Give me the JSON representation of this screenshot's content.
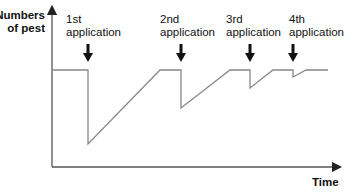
{
  "chart_data": {
    "type": "line",
    "title": "",
    "xlabel": "Time",
    "ylabel": "Numbers of pest",
    "ylabel_lines": [
      "Numbers",
      "of pest"
    ],
    "grid": false,
    "legend": null,
    "axis_ticks": "none",
    "series": [
      {
        "name": "Pest population",
        "color": "#888888",
        "points_px": [
          [
            52,
            70
          ],
          [
            88,
            70
          ],
          [
            88,
            144
          ],
          [
            160,
            70
          ],
          [
            181,
            70
          ],
          [
            181,
            108
          ],
          [
            230,
            70
          ],
          [
            250,
            70
          ],
          [
            250,
            88
          ],
          [
            273,
            70
          ],
          [
            293,
            70
          ],
          [
            293,
            77
          ],
          [
            306,
            70
          ],
          [
            328,
            70
          ]
        ]
      }
    ],
    "annotations": [
      {
        "line1": "1st",
        "line2": "application",
        "x": 88
      },
      {
        "line1": "2nd",
        "line2": "application",
        "x": 181
      },
      {
        "line1": "3rd",
        "line2": "application",
        "x": 250
      },
      {
        "line1": "4th",
        "line2": "application",
        "x": 293
      }
    ],
    "relative_values": {
      "baseline": 100,
      "drops_to": [
        23,
        60,
        80,
        93
      ],
      "description": "Population drops sharply after each pesticide application, then recovers to the baseline; each successive application has a smaller effect."
    }
  },
  "labels": {
    "y_axis": {
      "line1": "Numbers",
      "line2": "of pest"
    },
    "x_axis": "Time",
    "app1": {
      "line1": "1st",
      "line2": "application"
    },
    "app2": {
      "line1": "2nd",
      "line2": "application"
    },
    "app3": {
      "line1": "3rd",
      "line2": "application"
    },
    "app4": {
      "line1": "4th",
      "line2": "application"
    }
  }
}
